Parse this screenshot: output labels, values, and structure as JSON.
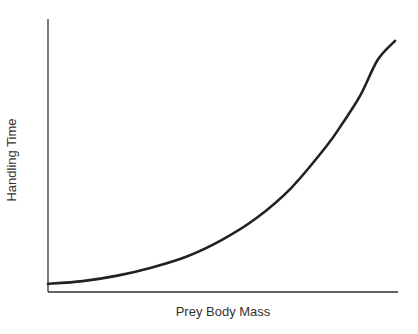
{
  "chart_data": {
    "type": "line",
    "title": "",
    "xlabel": "Prey Body Mass",
    "ylabel": "Handling Time",
    "grid": false,
    "legend": null,
    "ticks": false,
    "xlim": [
      0,
      1
    ],
    "ylim": [
      0,
      1
    ],
    "series": [
      {
        "name": "Handling time vs prey body mass",
        "color": "#222222",
        "x": [
          0.0,
          0.1,
          0.2,
          0.3,
          0.4,
          0.5,
          0.6,
          0.7,
          0.8,
          0.85,
          0.9,
          0.95,
          1.0
        ],
        "y": [
          0.03,
          0.04,
          0.06,
          0.09,
          0.13,
          0.19,
          0.27,
          0.38,
          0.53,
          0.62,
          0.72,
          0.85,
          0.92
        ]
      }
    ]
  },
  "axes": {
    "color": "#333333"
  }
}
